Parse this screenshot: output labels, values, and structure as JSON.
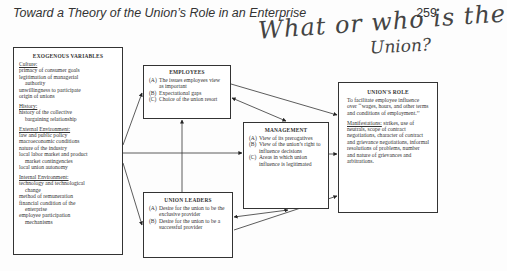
{
  "header": {
    "title": "Toward a Theory of the Union’s Role in an Enterprise",
    "page_number": "259"
  },
  "annotation": {
    "line1": "What or who is the",
    "line2": "Union?"
  },
  "exogenous": {
    "title": "EXOGENOUS VARIABLES",
    "sections": [
      {
        "heading": "Culture:",
        "items": [
          "primacy of consumer goals",
          "legitimation of managerial",
          "authority",
          "unwillingness to participate",
          "origin of unions"
        ]
      },
      {
        "heading": "History:",
        "items": [
          "history of the collective",
          "bargaining relationship"
        ]
      },
      {
        "heading": "External Environment:",
        "items": [
          "law and public policy",
          "macroeconomic conditions",
          "nature of the industry",
          "local labor market and product",
          "market contingencies",
          "local union autonomy"
        ]
      },
      {
        "heading": "Internal Environment:",
        "items": [
          "technology and technological",
          "change",
          "method of remuneration",
          "financial condition of the",
          "enterprise",
          "employee participation",
          "mechanisms"
        ]
      }
    ]
  },
  "employees": {
    "title": "EMPLOYEES",
    "items": [
      {
        "label": "(A)",
        "text": "The issues employees view as important"
      },
      {
        "label": "(B)",
        "text": "Expectational gaps"
      },
      {
        "label": "(C)",
        "text": "Choice of the union resort"
      }
    ]
  },
  "union_leaders": {
    "title": "UNION LEADERS",
    "items": [
      {
        "label": "(A)",
        "text": "Desire for the union to be the exclusive provider"
      },
      {
        "label": "(B)",
        "text": "Desire for the union to be a successful provider"
      }
    ]
  },
  "management": {
    "title": "MANAGEMENT",
    "items": [
      {
        "label": "(A)",
        "text": "View of its prerogatives"
      },
      {
        "label": "(B)",
        "text": "View of the union’s right to influence decisions"
      },
      {
        "label": "(C)",
        "text": "Areas in which union influence is legitimated"
      }
    ]
  },
  "unions_role": {
    "title": "UNION'S ROLE",
    "purpose": "To facilitate employee influence over ‘‘wages, hours, and other terms and conditions of employment.’’",
    "manifestations_heading": "Manifestations:",
    "manifestations_text": " strikes, use of neutrals, scope of contract negotiations, character of contract and grievance negotiations, informal resolutions of problems, number and nature of grievances and arbitrations."
  }
}
